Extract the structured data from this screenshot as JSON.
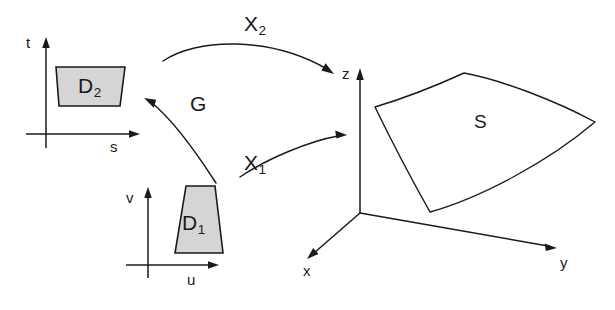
{
  "figure": {
    "background_color": "#ffffff",
    "ink_color": "#1a1a1a",
    "region_fill_color": "#d5d5d5",
    "surface_fill_color": "#ffffff"
  },
  "domain_2": {
    "region_label_base": "D",
    "region_label_sub": "2",
    "axis_vertical_label": "t",
    "axis_horizontal_label": "s"
  },
  "domain_1": {
    "region_label_base": "D",
    "region_label_sub": "1",
    "axis_vertical_label": "v",
    "axis_horizontal_label": "u"
  },
  "surface": {
    "label": "S",
    "axis_z_label": "z",
    "axis_y_label": "y",
    "axis_x_label": "x"
  },
  "maps": {
    "x2_base": "X",
    "x2_sub": "2",
    "x1_base": "X",
    "x1_sub": "1",
    "g": "G"
  }
}
